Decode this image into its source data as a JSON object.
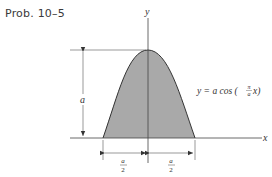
{
  "title": "Prob. 10–5",
  "axes": {
    "x_label": "x",
    "y_label": "y"
  },
  "curve": {
    "equation_lhs": "y = a cos (",
    "equation_frac_num": "π",
    "equation_frac_den": "a",
    "equation_rhs": "x)",
    "fill_color": "#a9a9a9",
    "stroke_color": "#333333"
  },
  "dimensions": {
    "height_label": "a",
    "left_half_num": "a",
    "left_half_den": "2",
    "right_half_num": "a",
    "right_half_den": "2"
  }
}
